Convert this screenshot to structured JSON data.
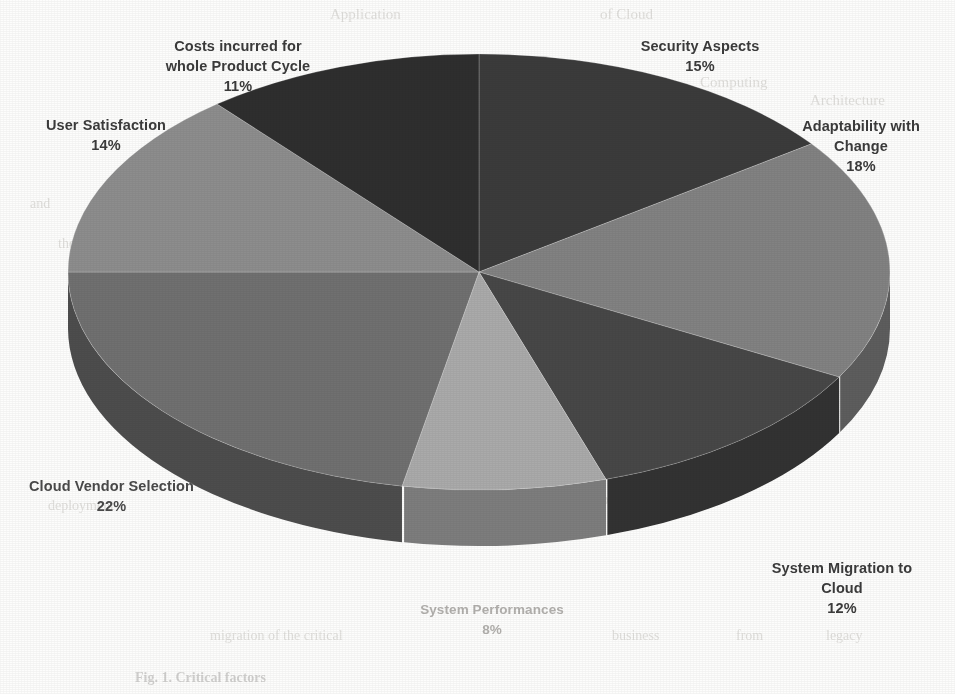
{
  "chart_data": {
    "type": "pie",
    "title": "",
    "subtitle": "",
    "xlabel": "",
    "ylabel": "",
    "legend_position": "none",
    "grid": false,
    "style": "3d-exploded-none-grayscale",
    "units": "percent",
    "categories": [
      "Security Aspects",
      "Adaptability with Change",
      "System Migration to Cloud",
      "System Performances",
      "Cloud Vendor Selection",
      "User Satisfaction",
      "Costs incurred for whole Product Cycle"
    ],
    "values": [
      15,
      18,
      12,
      8,
      22,
      14,
      11
    ],
    "value_labels": [
      "15%",
      "18%",
      "12%",
      "8%",
      "22%",
      "14%",
      "11%"
    ],
    "colors": [
      "#3a3a3a",
      "#828282",
      "#474747",
      "#aaaaaa",
      "#6f6f6f",
      "#8d8d8d",
      "#2f2f2f"
    ],
    "start_angle_deg": 0,
    "direction": "clockwise",
    "total": 100
  },
  "slices": [
    {
      "name": "Security Aspects",
      "pct_label": "15%",
      "value": 15,
      "color": "#3a3a3a",
      "side_color": "#262626"
    },
    {
      "name": "Adaptability with",
      "pct_label": "18%",
      "value": 18,
      "color": "#828282",
      "side_color": "#5d5d5d",
      "name_line2": "Change"
    },
    {
      "name": "System Migration to",
      "pct_label": "12%",
      "value": 12,
      "color": "#474747",
      "side_color": "#303030",
      "name_line2": "Cloud"
    },
    {
      "name": "System Performances",
      "pct_label": "8%",
      "value": 8,
      "color": "#aaaaaa",
      "side_color": "#7d7d7d"
    },
    {
      "name": "Cloud Vendor Selection",
      "pct_label": "22%",
      "value": 22,
      "color": "#6f6f6f",
      "side_color": "#4d4d4d"
    },
    {
      "name": "User Satisfaction",
      "pct_label": "14%",
      "value": 14,
      "color": "#8d8d8d",
      "side_color": "#656565"
    },
    {
      "name": "Costs incurred for",
      "pct_label": "11%",
      "value": 11,
      "color": "#2f2f2f",
      "side_color": "#1e1e1e",
      "name_line2": "whole Product Cycle"
    }
  ],
  "labels": {
    "costs_line1": "Costs incurred for",
    "costs_line2": "whole Product Cycle",
    "costs_pct": "11%",
    "security_line1": "Security Aspects",
    "security_pct": "15%",
    "adapt_line1": "Adaptability with",
    "adapt_line2": "Change",
    "adapt_pct": "18%",
    "user_line1": "User Satisfaction",
    "user_pct": "14%",
    "vendor_line1": "Cloud Vendor Selection",
    "vendor_pct": "22%",
    "migration_line1": "System Migration to",
    "migration_line2": "Cloud",
    "migration_pct": "12%",
    "performance_line1": "System Performances",
    "performance_pct": "8%"
  },
  "caption": {
    "text": "Fig. 1.  Critical factors"
  },
  "background_bleed": [
    {
      "text": "Application",
      "x": 330,
      "y": 6,
      "size": 15
    },
    {
      "text": "of Cloud",
      "x": 600,
      "y": 6,
      "size": 15
    },
    {
      "text": "Computing",
      "x": 700,
      "y": 74,
      "size": 15
    },
    {
      "text": "Architecture",
      "x": 810,
      "y": 92,
      "size": 15
    },
    {
      "text": "and",
      "x": 30,
      "y": 196,
      "size": 14
    },
    {
      "text": "services",
      "x": 742,
      "y": 168,
      "size": 14
    },
    {
      "text": "model",
      "x": 806,
      "y": 212,
      "size": 14
    },
    {
      "text": "the",
      "x": 58,
      "y": 236,
      "size": 14
    },
    {
      "text": "of",
      "x": 846,
      "y": 254,
      "size": 14
    },
    {
      "text": "deployment",
      "x": 48,
      "y": 498,
      "size": 14
    },
    {
      "text": "solution",
      "x": 596,
      "y": 492,
      "size": 14
    },
    {
      "text": "migration of the critical",
      "x": 210,
      "y": 628,
      "size": 14
    },
    {
      "text": "business",
      "x": 612,
      "y": 628,
      "size": 14
    },
    {
      "text": "from",
      "x": 736,
      "y": 628,
      "size": 14
    },
    {
      "text": "legacy",
      "x": 826,
      "y": 628,
      "size": 14
    }
  ]
}
